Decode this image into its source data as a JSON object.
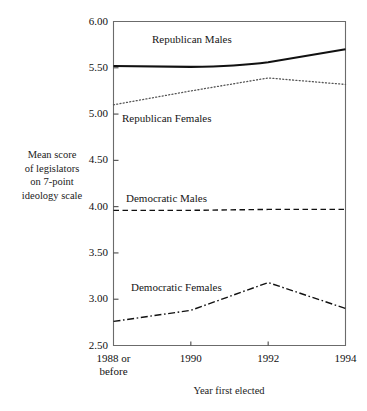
{
  "chart_data": {
    "type": "line",
    "title": "",
    "subtitle": "",
    "xlabel": "Year first elected",
    "ylabel": "Mean score of legislators on 7-point ideology scale",
    "ylabel_lines": [
      "Mean score",
      "of legislators",
      "on 7-point",
      "ideology scale"
    ],
    "x": [
      "1988 or before",
      "1990",
      "1992",
      "1994"
    ],
    "x_tick_labels": [
      {
        "line1": "1988 or",
        "line2": "before"
      },
      {
        "line1": "1990",
        "line2": ""
      },
      {
        "line1": "1992",
        "line2": ""
      },
      {
        "line1": "1994",
        "line2": ""
      }
    ],
    "xlim": [
      0,
      3
    ],
    "ylim": [
      2.5,
      6.0
    ],
    "y_ticks": [
      6.0,
      5.5,
      5.0,
      4.5,
      4.0,
      3.5,
      3.0,
      2.5
    ],
    "y_tick_labels": [
      "6.00",
      "5.50",
      "5.00",
      "4.50",
      "4.00",
      "3.50",
      "3.00",
      "2.50"
    ],
    "grid": false,
    "legend_position": "inline-annotations",
    "series": [
      {
        "name": "Republican Males",
        "label": "Republican Males",
        "values": [
          5.52,
          5.51,
          5.56,
          5.7
        ],
        "line_style": "solid",
        "line_width": 2.1,
        "color": "#111111"
      },
      {
        "name": "Republican Females",
        "label": "Republican Females",
        "values": [
          5.1,
          5.25,
          5.39,
          5.32
        ],
        "line_style": "dotted",
        "line_width": 1.3,
        "color": "#555555"
      },
      {
        "name": "Democratic Males",
        "label": "Democratic Males",
        "values": [
          3.96,
          3.96,
          3.97,
          3.97
        ],
        "line_style": "dashed",
        "line_width": 1.4,
        "color": "#111111"
      },
      {
        "name": "Democratic Females",
        "label": "Democratic Females",
        "values": [
          2.76,
          2.88,
          3.18,
          2.9
        ],
        "line_style": "dashdot",
        "line_width": 1.4,
        "color": "#111111"
      }
    ]
  },
  "annotations": {
    "republican_males": "Republican Males",
    "republican_females": "Republican Females",
    "democratic_males": "Democratic Males",
    "democratic_females": "Democratic Females"
  }
}
